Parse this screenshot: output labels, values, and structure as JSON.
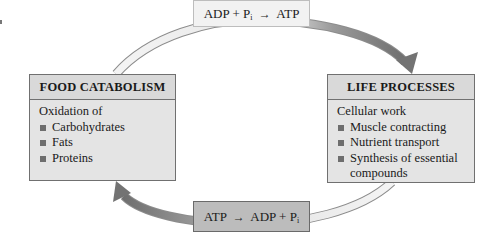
{
  "diagram": {
    "colors": {
      "box_fill": "#e4e4e4",
      "box_border": "#707070",
      "top_equation_fill": "#f2f2f2",
      "bottom_equation_fill": "#bcbcbc",
      "arrow_dark": "#7a7a7a",
      "arc_light": "#e8e8e8"
    },
    "left_box": {
      "title": "FOOD CATABOLISM",
      "intro": "Oxidation of",
      "items": [
        "Carbohydrates",
        "Fats",
        "Proteins"
      ]
    },
    "right_box": {
      "title": "LIFE PROCESSES",
      "intro": "Cellular work",
      "items": [
        "Muscle contracting",
        "Nutrient transport",
        "Synthesis of essential compounds"
      ]
    },
    "top_equation": {
      "left": "ADP + P",
      "subscript": "i",
      "arrow": "→",
      "right": "ATP"
    },
    "bottom_equation": {
      "left": "ATP",
      "arrow": "→",
      "right": "ADP + P",
      "subscript": "i"
    }
  }
}
